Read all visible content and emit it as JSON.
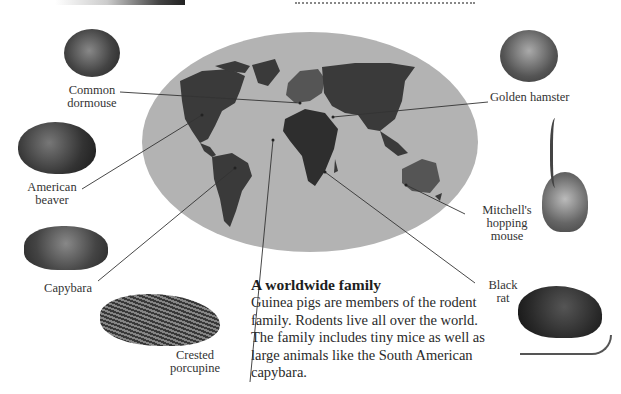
{
  "map": {
    "title": "World map of rodent habitats",
    "ocean_color": "#b3b3b3",
    "land_color": "#3a3a3a",
    "highlight_color": "#555555"
  },
  "animals": [
    {
      "id": "common-dormouse",
      "label_line1": "Common",
      "label_line2": "dormouse"
    },
    {
      "id": "american-beaver",
      "label_line1": "American",
      "label_line2": "beaver"
    },
    {
      "id": "capybara",
      "label_line1": "Capybara",
      "label_line2": ""
    },
    {
      "id": "crested-porcupine",
      "label_line1": "Crested",
      "label_line2": "porcupine"
    },
    {
      "id": "golden-hamster",
      "label_line1": "Golden hamster",
      "label_line2": ""
    },
    {
      "id": "mitchells-hopping-mouse",
      "label_line1": "Mitchell's",
      "label_line2": "hopping",
      "label_line3": "mouse"
    },
    {
      "id": "black-rat",
      "label_line1": "Black",
      "label_line2": "rat"
    }
  ],
  "caption": {
    "title": "A worldwide family",
    "body": "Guinea pigs are members of the rodent family. Rodents live all over the world. The family includes tiny mice as well as large animals like the South American capybara."
  }
}
